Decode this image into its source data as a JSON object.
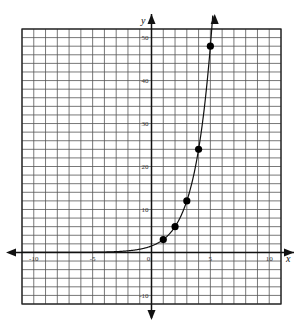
{
  "chart_data": {
    "type": "scatter",
    "title": "",
    "xlabel": "x",
    "ylabel": "y",
    "xlim": [
      -11,
      11
    ],
    "ylim": [
      -12,
      52
    ],
    "x_grid_step": 1,
    "y_grid_step": 2,
    "grid": true,
    "x_ticks": [
      -10,
      -5,
      0,
      5,
      10
    ],
    "x_tick_labels": [
      "-10",
      "-5",
      "0",
      "5",
      "10"
    ],
    "y_ticks": [
      -10,
      10,
      20,
      30,
      40,
      50
    ],
    "y_tick_labels": [
      "-10",
      "10",
      "20",
      "30",
      "40",
      "50"
    ],
    "points": [
      {
        "x": 1,
        "y": 3
      },
      {
        "x": 2,
        "y": 6
      },
      {
        "x": 3,
        "y": 12
      },
      {
        "x": 4,
        "y": 24
      },
      {
        "x": 5,
        "y": 48
      }
    ],
    "curve": {
      "function": "y = 1.5 * 2^x",
      "x_range": [
        -11,
        5.2
      ],
      "arrow_at_end": true
    },
    "colors": {
      "grid": "#555555",
      "axis": "#111111",
      "curve": "#111111",
      "points": "#000000"
    }
  }
}
